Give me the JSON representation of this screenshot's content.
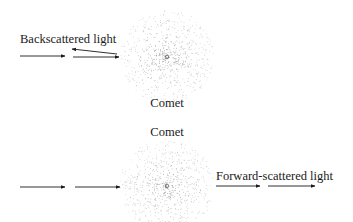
{
  "diagram": {
    "type": "comet-scattering-geometry",
    "colors": {
      "ink": "#1a1a1a",
      "dust": "#8a8a8a",
      "background": "#ffffff"
    },
    "top_panel": {
      "scenario": "backscatter",
      "label": "Backscattered light",
      "comet_label": "Comet",
      "comet": {
        "cx": 167,
        "cy": 57,
        "r": 47
      },
      "arrows": [
        {
          "name": "incident-1",
          "x1": 20,
          "y1": 56,
          "x2": 65,
          "y2": 56
        },
        {
          "name": "incident-2",
          "x1": 73,
          "y1": 57,
          "x2": 119,
          "y2": 57
        },
        {
          "name": "backscattered",
          "x1": 117,
          "y1": 54,
          "x2": 72,
          "y2": 49
        }
      ]
    },
    "bottom_panel": {
      "scenario": "forward-scatter",
      "label": "Forward-scattered light",
      "comet_label": "Comet",
      "comet": {
        "cx": 167,
        "cy": 186,
        "r": 47
      },
      "arrows": [
        {
          "name": "incident-1",
          "x1": 20,
          "y1": 187,
          "x2": 65,
          "y2": 187
        },
        {
          "name": "incident-2",
          "x1": 75,
          "y1": 187,
          "x2": 120,
          "y2": 187
        },
        {
          "name": "forward-1",
          "x1": 216,
          "y1": 186,
          "x2": 260,
          "y2": 186
        },
        {
          "name": "forward-2",
          "x1": 268,
          "y1": 186,
          "x2": 315,
          "y2": 186
        }
      ]
    }
  }
}
